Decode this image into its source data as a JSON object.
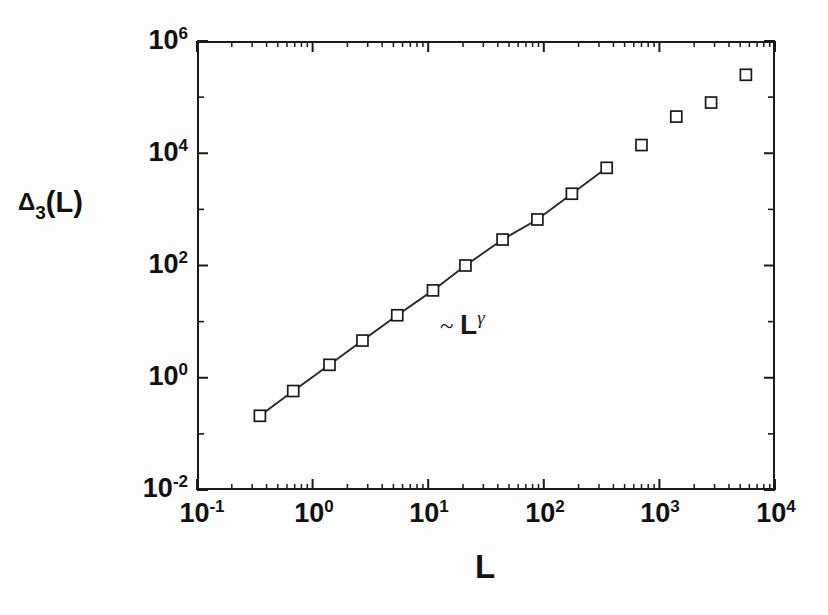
{
  "figure": {
    "background_color": "#fdfdfb",
    "ink_color": "#111111"
  },
  "axes": {
    "x_title": "L",
    "y_title_delta": "Δ",
    "y_title_sub": "3",
    "y_title_arg": "(L)",
    "x_tick_labels": [
      {
        "mantissa": "10",
        "exponent": "-1",
        "value": 0.1
      },
      {
        "mantissa": "10",
        "exponent": "0",
        "value": 1
      },
      {
        "mantissa": "10",
        "exponent": "1",
        "value": 10
      },
      {
        "mantissa": "10",
        "exponent": "2",
        "value": 100
      },
      {
        "mantissa": "10",
        "exponent": "3",
        "value": 1000
      },
      {
        "mantissa": "10",
        "exponent": "4",
        "value": 10000
      }
    ],
    "y_tick_labels": [
      {
        "mantissa": "10",
        "exponent": "6",
        "value": 1000000
      },
      {
        "mantissa": "10",
        "exponent": "4",
        "value": 10000
      },
      {
        "mantissa": "10",
        "exponent": "2",
        "value": 100
      },
      {
        "mantissa": "10",
        "exponent": "0",
        "value": 1
      },
      {
        "mantissa": "10",
        "exponent": "-2",
        "value": 0.01
      }
    ]
  },
  "annotation": {
    "tilde": "~",
    "base": "L",
    "exponent": "γ",
    "full_text": "~ Lγ"
  },
  "chart_data": {
    "type": "scatter",
    "title": "",
    "xlabel": "L",
    "ylabel": "Δ3(L)",
    "xscale": "log",
    "yscale": "log",
    "xlim": [
      0.1,
      10000
    ],
    "ylim": [
      0.01,
      1000000
    ],
    "grid": false,
    "legend": "none",
    "marker": "open-square",
    "series": [
      {
        "name": "delta3-power-law-branch",
        "connected_by_line": true,
        "fit_line_label": "~ L^gamma",
        "x": [
          0.35,
          0.68,
          1.4,
          2.7,
          5.4,
          11,
          21,
          44,
          88,
          175,
          350
        ],
        "y": [
          0.21,
          0.58,
          1.7,
          4.6,
          13,
          36,
          100,
          290,
          660,
          1900,
          5500
        ]
      },
      {
        "name": "delta3-saturating-branch",
        "connected_by_line": false,
        "x": [
          700,
          1400,
          2800,
          5600
        ],
        "y": [
          14000,
          45000,
          80000,
          250000
        ]
      }
    ]
  },
  "geometry": {
    "plot_left_px": 197,
    "plot_top_px": 41,
    "plot_width_px": 578,
    "plot_height_px": 449,
    "x_decade_px": 115.6,
    "y_decade_px": 56.125,
    "x_decades": [
      -1,
      0,
      1,
      2,
      3,
      4
    ],
    "y_decades": [
      -2,
      0,
      2,
      4,
      6
    ],
    "marker_size_px": 11
  }
}
